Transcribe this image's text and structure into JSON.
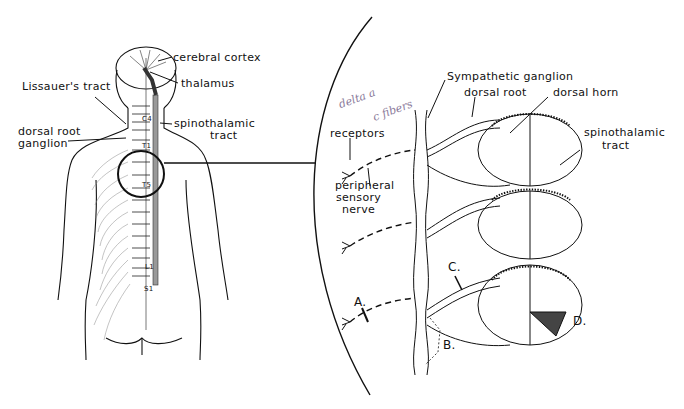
{
  "figure": {
    "left_panel": {
      "labels": {
        "cerebral_cortex": "cerebral cortex",
        "thalamus": "thalamus",
        "lissauers_tract": "Lissauer's tract",
        "dorsal_root_ganglion_1": "dorsal root",
        "dorsal_root_ganglion_2": "ganglion",
        "spinothalamic_1": "spinothalamic",
        "spinothalamic_2": "tract",
        "level_c4": "C4",
        "level_t1": "T1",
        "level_t5": "T5",
        "level_l1": "L1",
        "level_s1": "S1"
      }
    },
    "right_panel": {
      "labels": {
        "sympathetic_ganglion": "Sympathetic ganglion",
        "dorsal_root": "dorsal root",
        "dorsal_horn": "dorsal horn",
        "receptors": "receptors",
        "spinothalamic_1": "spinothalamic",
        "spinothalamic_2": "tract",
        "peripheral_1": "peripheral",
        "peripheral_2": "sensory",
        "peripheral_3": "nerve",
        "marker_a": "A.",
        "marker_b": "B.",
        "marker_c": "C.",
        "marker_d": "D."
      },
      "handwritten_note": {
        "line1": "delta a",
        "line2": "c fibers"
      }
    }
  }
}
